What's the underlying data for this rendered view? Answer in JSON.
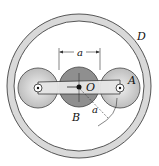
{
  "diagram": {
    "type": "planetary-gear-mechanism",
    "labels": {
      "ring": "D",
      "planet": "A",
      "center_gear": "B",
      "center_point": "O",
      "dim_top": "a",
      "dim_diag": "a"
    },
    "colors": {
      "ring_fill": "#d9d9d9",
      "ring_stroke": "#555555",
      "planet_fill": "#cfcfcf",
      "sun_fill": "#8f8f8f",
      "arm_fill": "#e6e6e6",
      "stroke": "#333333",
      "background": "#ffffff"
    }
  }
}
